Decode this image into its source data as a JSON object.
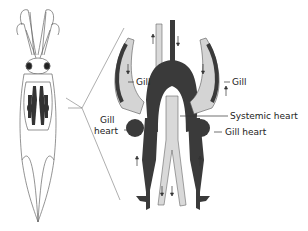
{
  "diagram": {
    "labels": {
      "gill_left": "Gill",
      "gill_right": "Gill",
      "gill_heart_left_line1": "Gill",
      "gill_heart_left_line2": "heart",
      "systemic_heart": "Systemic heart",
      "gill_heart_right": "Gill heart"
    },
    "colors": {
      "vessel_dark": "#3a3a3a",
      "vessel_light": "#d9d9d9",
      "outline": "#555555",
      "background": "#ffffff"
    }
  }
}
